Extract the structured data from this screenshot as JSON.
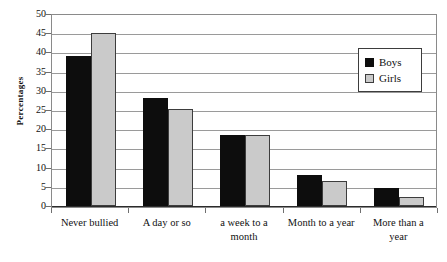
{
  "chart_data": {
    "type": "bar",
    "title": "",
    "xlabel": "",
    "ylabel": "Percentages",
    "ylim": [
      0,
      50
    ],
    "ytick_step": 5,
    "yticks": [
      "50",
      "45",
      "40",
      "35",
      "30",
      "25",
      "20",
      "15",
      "10",
      "5",
      "0"
    ],
    "grid": true,
    "legend_position": "top-right",
    "categories": [
      "Never bullied",
      "A day or so",
      "a week to a month",
      "Month to a year",
      "More than a year"
    ],
    "category_lines": [
      [
        "Never bullied"
      ],
      [
        "A day or so"
      ],
      [
        "a week to a",
        "month"
      ],
      [
        "Month to a year"
      ],
      [
        "More than a",
        "year"
      ]
    ],
    "series": [
      {
        "name": "Boys",
        "color": "#0d0d0d",
        "values": [
          39.0,
          28.0,
          18.6,
          8.0,
          4.8
        ]
      },
      {
        "name": "Girls",
        "color": "#cacaca",
        "values": [
          45.0,
          25.3,
          18.4,
          6.6,
          2.3
        ]
      }
    ]
  },
  "legend": {
    "items": [
      {
        "label": "Boys"
      },
      {
        "label": "Girls"
      }
    ]
  }
}
